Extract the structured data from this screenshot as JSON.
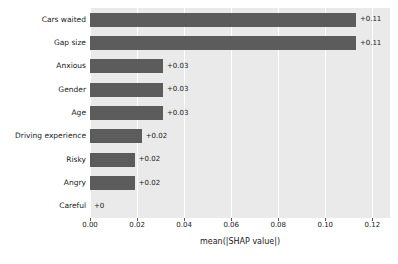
{
  "chart_data": {
    "type": "bar",
    "orientation": "horizontal",
    "title": "",
    "xlabel": "mean(|SHAP value|)",
    "ylabel": "",
    "xlim": [
      0,
      0.1275
    ],
    "xticks": [
      "0.00",
      "0.02",
      "0.04",
      "0.06",
      "0.08",
      "0.10",
      "0.12"
    ],
    "xtick_values": [
      0.0,
      0.02,
      0.04,
      0.06,
      0.08,
      0.1,
      0.12
    ],
    "grid": "vertical",
    "legend": "none",
    "categories": [
      "Cars waited",
      "Gap size",
      "Anxious",
      "Gender",
      "Age",
      "Driving experience",
      "Risky",
      "Angry",
      "Careful"
    ],
    "values": [
      0.113,
      0.113,
      0.031,
      0.031,
      0.031,
      0.022,
      0.019,
      0.019,
      0.0
    ],
    "data_labels": [
      "+0.11",
      "+0.11",
      "+0.03",
      "+0.03",
      "+0.03",
      "+0.02",
      "+0.02",
      "+0.02",
      "+0"
    ],
    "bar_color": "#5c5c5c",
    "plot_background": "#eaeaea",
    "gridline_color": "#ffffff",
    "figure_background": "#ffffff"
  }
}
